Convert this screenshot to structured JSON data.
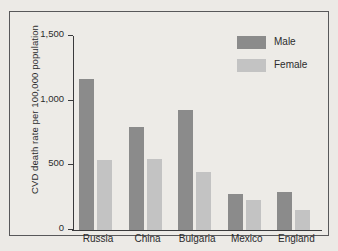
{
  "chart_data": {
    "type": "bar",
    "title": "",
    "xlabel": "",
    "ylabel": "CVD death rate per 100,000 population",
    "ylim": [
      0,
      1500
    ],
    "yticks": [
      "0",
      "500",
      "1,000",
      "1,500"
    ],
    "ytick_values": [
      0,
      500,
      1000,
      1500
    ],
    "grid": false,
    "legend_position": "top-right",
    "categories": [
      "Russia",
      "China",
      "Bulgaria",
      "Mexico",
      "England"
    ],
    "series": [
      {
        "name": "Male",
        "color": "#8b8b8b",
        "values": [
          1165,
          800,
          930,
          275,
          295
        ]
      },
      {
        "name": "Female",
        "color": "#c3c3c3",
        "values": [
          540,
          550,
          450,
          230,
          155
        ]
      }
    ]
  },
  "figure": {
    "background_color": "#eceae6",
    "frame_color": "#58585a",
    "axis_color": "#3a3a3c",
    "text_color": "#2b2b2d"
  }
}
